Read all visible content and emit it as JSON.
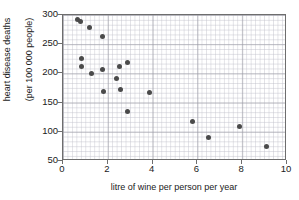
{
  "chart_data": {
    "type": "scatter",
    "title": "",
    "xlabel": "litre of wine per person per year",
    "ylabel_line1": "heart disease deaths",
    "ylabel_line2": "(per 100 000 people)",
    "xlim": [
      0,
      10
    ],
    "ylim": [
      50,
      300
    ],
    "xticks": [
      0,
      2,
      4,
      6,
      8,
      10
    ],
    "yticks": [
      50,
      100,
      150,
      200,
      250,
      300
    ],
    "grid": true,
    "grid_minor": true,
    "legend": "none",
    "marker_color": "#4a4a4a",
    "points": [
      {
        "x": 0.65,
        "y": 292
      },
      {
        "x": 0.78,
        "y": 289
      },
      {
        "x": 1.2,
        "y": 279
      },
      {
        "x": 1.75,
        "y": 263
      },
      {
        "x": 0.82,
        "y": 226
      },
      {
        "x": 0.82,
        "y": 211
      },
      {
        "x": 1.25,
        "y": 199
      },
      {
        "x": 1.75,
        "y": 207
      },
      {
        "x": 1.8,
        "y": 169
      },
      {
        "x": 2.4,
        "y": 192
      },
      {
        "x": 2.5,
        "y": 211
      },
      {
        "x": 2.55,
        "y": 173
      },
      {
        "x": 2.9,
        "y": 219
      },
      {
        "x": 2.9,
        "y": 135
      },
      {
        "x": 3.85,
        "y": 168
      },
      {
        "x": 5.8,
        "y": 118
      },
      {
        "x": 6.5,
        "y": 90
      },
      {
        "x": 7.9,
        "y": 109
      },
      {
        "x": 9.1,
        "y": 75
      }
    ]
  }
}
